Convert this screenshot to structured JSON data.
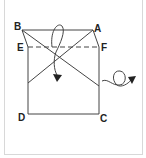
{
  "diagram": {
    "type": "origami-fold-instruction",
    "labels": {
      "a": "A",
      "b": "B",
      "c": "C",
      "d": "D",
      "e": "E",
      "f": "F"
    },
    "colors": {
      "line": "#444444",
      "border": "#d8d8d8",
      "background": "#ffffff"
    },
    "elements": [
      "square-paper-outline",
      "dashed-fold-line-E-F",
      "diagonal-crease-B-to-right-edge",
      "diagonal-crease-A-to-left-edge",
      "curved-fold-arrow",
      "turn-over-loop-arrow"
    ]
  }
}
